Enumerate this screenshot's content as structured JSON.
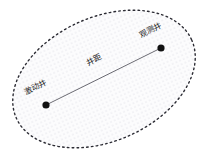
{
  "figure": {
    "title": "",
    "colors": {
      "background": "#ffffff",
      "boundary_stroke": "#2b2b33",
      "fill_dot": "#cfcfd8",
      "fill_base": "#fcfcfd",
      "well_marker": "#111111",
      "connector_line": "#6b6b73",
      "label_text": "#1a1a1a"
    },
    "boundary": {
      "shape": "ellipse",
      "style": "dashed",
      "center_x": 104,
      "center_y": 79,
      "radius_x": 96,
      "radius_y": 62,
      "rotation_deg": -24,
      "fill_pattern": "dot-grid"
    },
    "wells": [
      {
        "id": "excitation-well",
        "label": "激动井",
        "marker": "filled-circle",
        "x": 46,
        "y": 105,
        "label_x": 26,
        "label_y": 95,
        "label_rotation_deg": -27
      },
      {
        "id": "observation-well",
        "label": "观测井",
        "marker": "filled-circle",
        "x": 161,
        "y": 48,
        "label_x": 141,
        "label_y": 38,
        "label_rotation_deg": -27
      }
    ],
    "connector": {
      "id": "well-spacing",
      "label": "井距",
      "from_x": 46,
      "from_y": 105,
      "to_x": 161,
      "to_y": 48,
      "label_x": 88,
      "label_y": 66,
      "label_rotation_deg": -27
    }
  }
}
